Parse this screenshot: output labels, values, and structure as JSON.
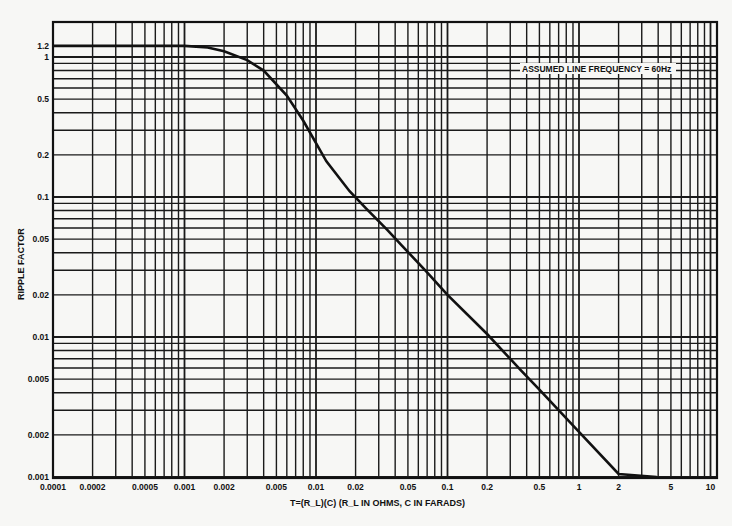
{
  "chart_data": {
    "type": "line",
    "title": "",
    "annotation": "ASSUMED LINE FREQUENCY = 60Hz",
    "xlabel": "T=(R_L)(C) (R_L IN OHMS, C IN FARADS)",
    "ylabel": "RIPPLE FACTOR",
    "xscale": "log",
    "yscale": "log",
    "xlim": [
      0.0001,
      10
    ],
    "ylim": [
      0.001,
      1.2
    ],
    "grid": true,
    "legend": "none",
    "x_tick_labels": [
      "0.0001",
      "0.0002",
      "0.0005",
      "0.001",
      "0.002",
      "0.005",
      "0.01",
      "0.02",
      "0.05",
      "0.1",
      "0.2",
      "0.5",
      "1",
      "2",
      "5",
      "10"
    ],
    "x_ticks": [
      0.0001,
      0.0002,
      0.0005,
      0.001,
      0.002,
      0.005,
      0.01,
      0.02,
      0.05,
      0.1,
      0.2,
      0.5,
      1,
      2,
      5,
      10
    ],
    "y_tick_labels": [
      "1.2",
      "1",
      "0.5",
      "0.2",
      "0.1",
      "0.05",
      "0.02",
      "0.01",
      "0.005",
      "0.002",
      "0.001"
    ],
    "y_ticks": [
      1.2,
      1,
      0.5,
      0.2,
      0.1,
      0.05,
      0.02,
      0.01,
      0.005,
      0.002,
      0.001
    ],
    "series": [
      {
        "name": "Ripple factor vs T",
        "x": [
          0.0001,
          0.0005,
          0.001,
          0.0015,
          0.002,
          0.003,
          0.004,
          0.006,
          0.008,
          0.012,
          0.018,
          0.024,
          0.035,
          0.045,
          0.07,
          0.1,
          0.2,
          0.36,
          0.5,
          1,
          2,
          3.9
        ],
        "y": [
          1.2,
          1.2,
          1.2,
          1.17,
          1.1,
          0.95,
          0.8,
          0.53,
          0.35,
          0.18,
          0.11,
          0.083,
          0.058,
          0.045,
          0.029,
          0.02,
          0.0105,
          0.0058,
          0.0042,
          0.0021,
          0.00105,
          0.001
        ]
      }
    ]
  }
}
